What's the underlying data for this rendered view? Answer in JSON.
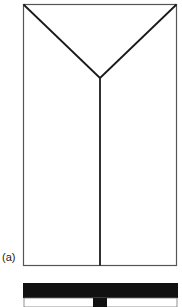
{
  "figure": {
    "panel_label": "(a)",
    "stroke_color": "#1a1a1a",
    "fill_color": "#111111"
  }
}
